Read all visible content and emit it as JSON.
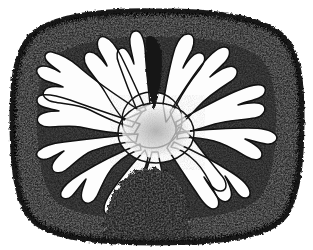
{
  "figure": {
    "domain": "Natural-Image",
    "kind": "scanned-engraving",
    "subject_label": "cerebellum-sagittal-section",
    "title": "",
    "caption": "",
    "background_color": "#ffffff",
    "ink_color": "#111111",
    "medium": "stipple and line engraving, black ink on white paper",
    "canvas": {
      "width": 313,
      "height": 250
    }
  },
  "specimen": {
    "outline_name": "rounded-square-section-outline",
    "outline_color": "#141414",
    "bounds": {
      "left": 18,
      "top": 12,
      "right": 300,
      "bottom": 241
    },
    "cortex": {
      "label": "granular-cortex-band",
      "fill_color": "#1a1a1a",
      "texture": "dense-irregular-stipple",
      "band_thickness_px": 26
    },
    "medulla": {
      "label": "white-matter-arbor-vitae",
      "fill_color": "#fdfdfd",
      "branch_count": 12,
      "branch_outline_color": "#121212"
    },
    "hub": {
      "label": "central-medullary-hub",
      "center": {
        "x": 156,
        "y": 131
      },
      "fill_color": "#dedede",
      "texture": "fine-grey-stipple"
    },
    "dark_regions": [
      {
        "name": "top-central-dark-wedge",
        "center": {
          "x": 153,
          "y": 62
        },
        "fill_color": "#171717"
      },
      {
        "name": "bottom-central-dark-mound",
        "center": {
          "x": 152,
          "y": 200
        },
        "fill_color": "#191919"
      },
      {
        "name": "upper-left-dark-fissure",
        "center": {
          "x": 96,
          "y": 57
        },
        "fill_color": "#171717"
      },
      {
        "name": "upper-right-dark-fissure",
        "center": {
          "x": 216,
          "y": 58
        },
        "fill_color": "#171717"
      }
    ],
    "branches": [
      {
        "index": 0,
        "name": "branch-upper-left-outer",
        "angle_deg": 150,
        "tip": {
          "x": 48,
          "y": 58
        },
        "lobes": 3
      },
      {
        "index": 1,
        "name": "branch-left-upper",
        "angle_deg": 168,
        "tip": {
          "x": 37,
          "y": 92
        },
        "lobes": 3
      },
      {
        "index": 2,
        "name": "branch-left-mid",
        "angle_deg": 182,
        "tip": {
          "x": 33,
          "y": 122
        },
        "lobes": 3
      },
      {
        "index": 3,
        "name": "branch-left-lower",
        "angle_deg": 198,
        "tip": {
          "x": 40,
          "y": 152
        },
        "lobes": 3
      },
      {
        "index": 4,
        "name": "branch-lower-left",
        "angle_deg": 218,
        "tip": {
          "x": 62,
          "y": 182
        },
        "lobes": 2
      },
      {
        "index": 5,
        "name": "branch-bottom-left",
        "angle_deg": 238,
        "tip": {
          "x": 96,
          "y": 200
        },
        "lobes": 2
      },
      {
        "index": 6,
        "name": "branch-top-left-inner",
        "angle_deg": 112,
        "tip": {
          "x": 104,
          "y": 40
        },
        "lobes": 3
      },
      {
        "index": 7,
        "name": "branch-top-center-left",
        "angle_deg": 96,
        "tip": {
          "x": 137,
          "y": 32
        },
        "lobes": 2
      },
      {
        "index": 8,
        "name": "branch-top-center-right",
        "angle_deg": 78,
        "tip": {
          "x": 178,
          "y": 35
        },
        "lobes": 3
      },
      {
        "index": 9,
        "name": "branch-top-right-inner",
        "angle_deg": 60,
        "tip": {
          "x": 213,
          "y": 44
        },
        "lobes": 3
      },
      {
        "index": 10,
        "name": "branch-right-upper",
        "angle_deg": 28,
        "tip": {
          "x": 262,
          "y": 72
        },
        "lobes": 4
      },
      {
        "index": 11,
        "name": "branch-right-mid",
        "angle_deg": 5,
        "tip": {
          "x": 276,
          "y": 112
        },
        "lobes": 3
      },
      {
        "index": 12,
        "name": "branch-right-lower",
        "angle_deg": 338,
        "tip": {
          "x": 268,
          "y": 152
        },
        "lobes": 3
      },
      {
        "index": 13,
        "name": "branch-bottom-right",
        "angle_deg": 312,
        "tip": {
          "x": 232,
          "y": 192
        },
        "lobes": 3
      }
    ]
  }
}
